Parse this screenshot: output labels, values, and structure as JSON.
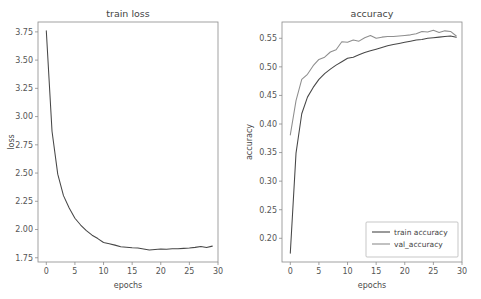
{
  "figure": {
    "background_color": "#ffffff",
    "width": 481,
    "height": 299
  },
  "chart_data": [
    {
      "type": "line",
      "title": "train loss",
      "xlabel": "epochs",
      "ylabel": "loss",
      "xlim": [
        -1.45,
        30.0
      ],
      "ylim": [
        1.7125,
        3.8375
      ],
      "xticks": [
        0,
        5,
        10,
        15,
        20,
        25,
        30
      ],
      "xtick_labels": [
        "0",
        "5",
        "10",
        "15",
        "20",
        "25",
        "30"
      ],
      "yticks": [
        1.75,
        2.0,
        2.25,
        2.5,
        2.75,
        3.0,
        3.25,
        3.5,
        3.75
      ],
      "ytick_labels": [
        "1.75",
        "2.00",
        "2.25",
        "2.50",
        "2.75",
        "3.00",
        "3.25",
        "3.50",
        "3.75"
      ],
      "grid": false,
      "legend": null,
      "x": [
        0,
        1,
        2,
        3,
        4,
        5,
        6,
        7,
        8,
        9,
        10,
        11,
        12,
        13,
        14,
        15,
        16,
        17,
        18,
        19,
        20,
        21,
        22,
        23,
        24,
        25,
        26,
        27,
        28,
        29
      ],
      "series": [
        {
          "name": "train loss",
          "color": "#474747",
          "values": [
            3.76,
            2.87,
            2.49,
            2.3,
            2.19,
            2.1,
            2.04,
            1.99,
            1.95,
            1.92,
            1.885,
            1.875,
            1.862,
            1.848,
            1.843,
            1.838,
            1.836,
            1.828,
            1.818,
            1.824,
            1.828,
            1.826,
            1.829,
            1.829,
            1.833,
            1.836,
            1.842,
            1.85,
            1.841,
            1.853
          ]
        }
      ]
    },
    {
      "type": "line",
      "title": "accuracy",
      "xlabel": "epochs",
      "ylabel": "accuracy",
      "xlim": [
        -1.45,
        30.0
      ],
      "ylim": [
        0.1585,
        0.5785
      ],
      "xticks": [
        0,
        5,
        10,
        15,
        20,
        25,
        30
      ],
      "xtick_labels": [
        "0",
        "5",
        "10",
        "15",
        "20",
        "25",
        "30"
      ],
      "yticks": [
        0.2,
        0.25,
        0.3,
        0.35,
        0.4,
        0.45,
        0.5,
        0.55
      ],
      "ytick_labels": [
        "0.20",
        "0.25",
        "0.30",
        "0.35",
        "0.40",
        "0.45",
        "0.50",
        "0.55"
      ],
      "grid": false,
      "legend": {
        "position": "lower right",
        "entries": [
          "train accuracy",
          "val_accuracy"
        ]
      },
      "x": [
        0,
        1,
        2,
        3,
        4,
        5,
        6,
        7,
        8,
        9,
        10,
        11,
        12,
        13,
        14,
        15,
        16,
        17,
        18,
        19,
        20,
        21,
        22,
        23,
        24,
        25,
        26,
        27,
        28,
        29
      ],
      "series": [
        {
          "name": "train accuracy",
          "color": "#474747",
          "values": [
            0.174,
            0.349,
            0.418,
            0.447,
            0.464,
            0.478,
            0.488,
            0.496,
            0.503,
            0.509,
            0.515,
            0.517,
            0.521,
            0.525,
            0.528,
            0.531,
            0.534,
            0.537,
            0.539,
            0.541,
            0.543,
            0.545,
            0.547,
            0.548,
            0.55,
            0.551,
            0.552,
            0.553,
            0.554,
            0.552
          ]
        },
        {
          "name": "val_accuracy",
          "color": "#8e8e8e",
          "values": [
            0.381,
            0.441,
            0.478,
            0.487,
            0.502,
            0.513,
            0.517,
            0.526,
            0.53,
            0.544,
            0.543,
            0.547,
            0.545,
            0.551,
            0.555,
            0.55,
            0.552,
            0.553,
            0.553,
            0.554,
            0.555,
            0.556,
            0.558,
            0.562,
            0.561,
            0.564,
            0.56,
            0.563,
            0.562,
            0.554
          ]
        }
      ]
    }
  ]
}
